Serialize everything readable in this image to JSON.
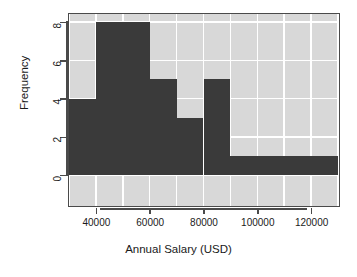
{
  "chart_data": {
    "type": "bar",
    "title": "",
    "subtitle": "",
    "xlabel": "Annual Salary (USD)",
    "ylabel": "Frequency",
    "categories": [
      "30000-40000",
      "40000-50000",
      "50000-60000",
      "60000-70000",
      "70000-80000",
      "80000-90000",
      "90000-100000",
      "100000-110000",
      "110000-120000",
      "120000-130000"
    ],
    "bin_edges": [
      30000,
      40000,
      50000,
      60000,
      70000,
      80000,
      90000,
      100000,
      110000,
      120000,
      130000
    ],
    "bin_width": 10000,
    "values": [
      4,
      8,
      8,
      5,
      3,
      5,
      1,
      1,
      1,
      1
    ],
    "xlim": [
      30000,
      130000
    ],
    "ylim": [
      0,
      8
    ],
    "x_ticks": [
      40000,
      60000,
      80000,
      100000,
      120000
    ],
    "x_tick_labels": [
      "40000",
      "60000",
      "80000",
      "100000",
      "120000"
    ],
    "y_ticks": [
      0,
      2,
      4,
      6,
      8
    ],
    "y_tick_labels": [
      "0",
      "2",
      "4",
      "6",
      "8"
    ],
    "grid": true,
    "legend": null,
    "colors": {
      "bar_fill": "#3a3a3a",
      "panel_background": "#d8d8d8",
      "grid_line": "#ffffff",
      "axis": "#4a4a4a",
      "figure_background": "#ffffff",
      "text": "#1a1a1a"
    }
  }
}
